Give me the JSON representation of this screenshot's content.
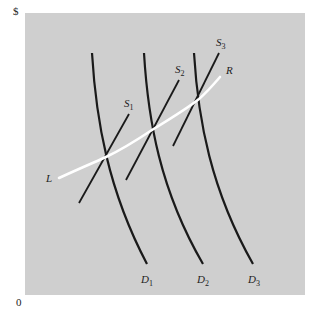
{
  "figure": {
    "y_axis_label": "$",
    "origin_label": "0",
    "background_color": "#cfcfcf",
    "curve_color": "#1a1a1a",
    "highlight_color": "#ffffff"
  },
  "curves": {
    "demand": [
      {
        "name": "D",
        "sub": "1",
        "path": "M92,53 C96,120 108,190 147,264",
        "label_x": 141,
        "label_y": 283
      },
      {
        "name": "D",
        "sub": "2",
        "path": "M144,53 C148,120 160,190 203,264",
        "label_x": 197,
        "label_y": 283
      },
      {
        "name": "D",
        "sub": "3",
        "path": "M194,53 C198,120 211,190 253,264",
        "label_x": 248,
        "label_y": 283
      }
    ],
    "supply": [
      {
        "name": "S",
        "sub": "1",
        "x1": 79,
        "y1": 203,
        "x2": 129,
        "y2": 114,
        "label_x": 124,
        "label_y": 107
      },
      {
        "name": "S",
        "sub": "2",
        "x1": 126,
        "y1": 180,
        "x2": 179,
        "y2": 80,
        "label_x": 175,
        "label_y": 73
      },
      {
        "name": "S",
        "sub": "3",
        "x1": 173,
        "y1": 146,
        "x2": 219,
        "y2": 53,
        "label_x": 216,
        "label_y": 46
      }
    ],
    "path_curve": {
      "start_label": "L",
      "end_label": "R",
      "path": "M59,178 C85,166 100,160 106,157 C125,148 140,138 152,130 C170,119 188,108 199,99 C207,92 214,84 220,77",
      "start_label_x": 46,
      "start_label_y": 182,
      "end_label_x": 226,
      "end_label_y": 74
    }
  }
}
